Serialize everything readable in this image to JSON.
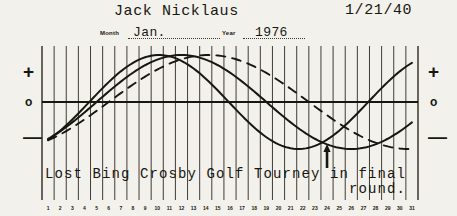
{
  "sheet": {
    "title": "Biorhythm chart",
    "paper_color": "#f3f1ec",
    "ink_color": "#18170f"
  },
  "header": {
    "subject_name": "Jack Nicklaus",
    "birthdate": "1/21/40",
    "month_label": "Month",
    "month_value": "Jan.",
    "year_label": "Year",
    "year_value": "1976"
  },
  "axis": {
    "left_plus": "+",
    "left_zero": "o",
    "left_minus": "—",
    "right_plus": "+",
    "right_zero": "o",
    "right_minus": "—"
  },
  "caption": {
    "line1": "Lost Bing Crosby Golf Tourney in final",
    "line2": "round.",
    "marker_day": 24,
    "marker_icon": "up-arrow-icon"
  },
  "days": [
    1,
    2,
    3,
    4,
    5,
    6,
    7,
    8,
    9,
    10,
    11,
    12,
    13,
    14,
    15,
    16,
    17,
    18,
    19,
    20,
    21,
    22,
    23,
    24,
    25,
    26,
    27,
    28,
    29,
    30,
    31
  ],
  "chart_data": {
    "type": "line",
    "xlabel": "",
    "ylabel": "",
    "x": [
      1,
      2,
      3,
      4,
      5,
      6,
      7,
      8,
      9,
      10,
      11,
      12,
      13,
      14,
      15,
      16,
      17,
      18,
      19,
      20,
      21,
      22,
      23,
      24,
      25,
      26,
      27,
      28,
      29,
      30,
      31
    ],
    "ylim": [
      -1,
      1
    ],
    "grid": true,
    "legend": "none",
    "zero_line": 0,
    "series": [
      {
        "name": "Physical",
        "style": "solid",
        "period_days": 23,
        "phase_day_at_zero_rising": 4.4,
        "values": [
          -0.86,
          -0.7,
          -0.48,
          -0.22,
          0.05,
          0.32,
          0.56,
          0.76,
          0.91,
          0.99,
          1.0,
          0.94,
          0.81,
          0.63,
          0.4,
          0.14,
          -0.13,
          -0.39,
          -0.62,
          -0.81,
          -0.94,
          -1.0,
          -0.98,
          -0.89,
          -0.74,
          -0.53,
          -0.28,
          -0.01,
          0.26,
          0.51,
          0.72
        ]
      },
      {
        "name": "Emotional",
        "style": "solid",
        "period_days": 28,
        "phase_day_at_zero_rising": 5.0,
        "values": [
          -0.78,
          -0.62,
          -0.43,
          -0.22,
          0.0,
          0.22,
          0.43,
          0.62,
          0.78,
          0.9,
          0.97,
          1.0,
          0.97,
          0.9,
          0.78,
          0.62,
          0.43,
          0.22,
          0.0,
          -0.22,
          -0.43,
          -0.62,
          -0.78,
          -0.9,
          -0.97,
          -1.0,
          -0.97,
          -0.9,
          -0.78,
          -0.62,
          -0.43
        ]
      },
      {
        "name": "Intellectual",
        "style": "dashed",
        "period_days": 33,
        "phase_day_at_zero_rising": 6.0,
        "values": [
          -0.71,
          -0.54,
          -0.37,
          -0.19,
          0.0,
          0.19,
          0.37,
          0.54,
          0.69,
          0.82,
          0.91,
          0.97,
          1.0,
          0.99,
          0.94,
          0.86,
          0.75,
          0.6,
          0.44,
          0.26,
          0.07,
          -0.13,
          -0.32,
          -0.49,
          -0.65,
          -0.79,
          -0.9,
          -0.97,
          -1.0,
          -0.99,
          -0.94
        ]
      }
    ],
    "annotations": [
      {
        "day": 24,
        "text": "critical low",
        "icon": "up-arrow-icon"
      }
    ]
  }
}
